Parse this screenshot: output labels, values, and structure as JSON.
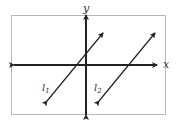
{
  "diagram": {
    "type": "coordinate-plane",
    "frame_color": "#b8b8b8",
    "line_color": "#222222",
    "axes": {
      "x_label": "x",
      "y_label": "y"
    },
    "lines": [
      {
        "name": "l1",
        "label_main": "l",
        "label_sub": "1",
        "from": [
          47,
          101
        ],
        "to": [
          103,
          33
        ]
      },
      {
        "name": "l2",
        "label_main": "l",
        "label_sub": "2",
        "from": [
          99,
          101
        ],
        "to": [
          155,
          33
        ]
      }
    ]
  }
}
